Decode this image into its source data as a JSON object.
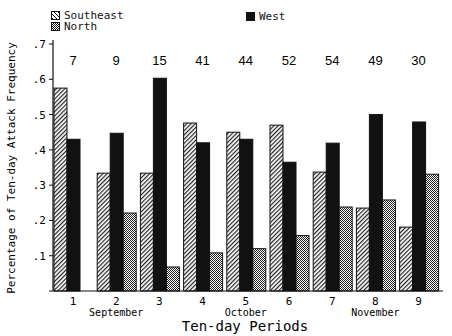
{
  "chart_data": {
    "type": "bar",
    "title": "",
    "xlabel": "Ten-day Periods",
    "ylabel": "Percentage of Ten-day Attack Frequency",
    "ylim": [
      0,
      0.7
    ],
    "yticks": [
      ".1",
      ".2",
      ".3",
      ".4",
      ".5",
      ".6",
      ".7"
    ],
    "categories": [
      "1",
      "2",
      "3",
      "4",
      "5",
      "6",
      "7",
      "8",
      "9"
    ],
    "month_labels": [
      {
        "label": "September",
        "under_category": "2"
      },
      {
        "label": "October",
        "under_category": "5"
      },
      {
        "label": "November",
        "under_category": "8"
      }
    ],
    "series": [
      {
        "name": "Southeast",
        "pattern": "diagonal-hatch",
        "values": [
          0.575,
          0.334,
          0.334,
          0.476,
          0.45,
          0.47,
          0.337,
          0.235,
          0.181
        ]
      },
      {
        "name": "West",
        "pattern": "solid-black",
        "values": [
          0.43,
          0.447,
          0.603,
          0.42,
          0.43,
          0.365,
          0.419,
          0.5,
          0.479
        ]
      },
      {
        "name": "North",
        "pattern": "crosshatch",
        "values": [
          0,
          0.221,
          0.068,
          0.108,
          0.12,
          0.157,
          0.238,
          0.258,
          0.331
        ]
      }
    ],
    "annotations": [
      "7",
      "9",
      "15",
      "41",
      "44",
      "52",
      "54",
      "49",
      "30"
    ],
    "annotation_meaning": "counts above each period",
    "legend_position": "top",
    "grid": false
  },
  "legend": {
    "southeast": "Southeast",
    "north": "North",
    "west": "West"
  }
}
